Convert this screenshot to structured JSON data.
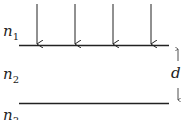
{
  "diagram": {
    "media": [
      {
        "name": "n",
        "subscript": "1"
      },
      {
        "name": "n",
        "subscript": "2"
      },
      {
        "name": "n",
        "subscript": "3"
      }
    ],
    "thickness_label": "d",
    "incident_arrow_count": 4,
    "line_color": "#222222"
  }
}
